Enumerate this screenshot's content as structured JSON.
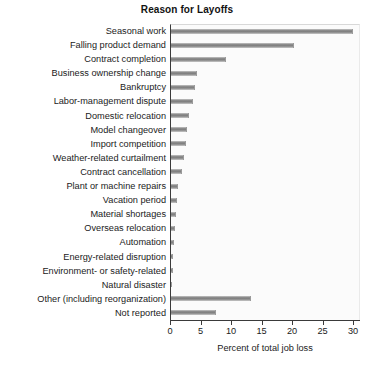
{
  "chart_data": {
    "type": "bar",
    "orientation": "horizontal",
    "title": "Reason for Layoffs",
    "xlabel": "Percent of total job loss",
    "ylabel": "",
    "xlim": [
      0,
      30
    ],
    "xticks": [
      0,
      5,
      10,
      15,
      20,
      25,
      30
    ],
    "grid": false,
    "legend": null,
    "bar_color": "#8f8f8f",
    "categories": [
      "Seasonal work",
      "Falling product demand",
      "Contract completion",
      "Business ownership change",
      "Bankruptcy",
      "Labor-management dispute",
      "Domestic relocation",
      "Model changeover",
      "Import competition",
      "Weather-related curtailment",
      "Contract cancellation",
      "Plant or machine repairs",
      "Vacation period",
      "Material shortages",
      "Overseas relocation",
      "Automation",
      "Energy-related disruption",
      "Environment- or safety-related",
      "Natural disaster",
      "Other (including reorganization)",
      "Not reported"
    ],
    "values": [
      29.8,
      20.1,
      9.0,
      4.3,
      3.9,
      3.6,
      3.0,
      2.6,
      2.4,
      2.1,
      1.8,
      1.2,
      1.0,
      0.8,
      0.7,
      0.5,
      0.4,
      0.3,
      0.2,
      13.1,
      7.4
    ]
  }
}
